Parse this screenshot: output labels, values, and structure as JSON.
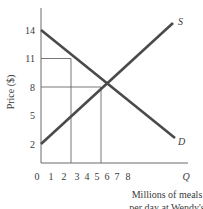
{
  "chart_data": {
    "type": "line",
    "title": "",
    "xlabel": "Millions of meals per day at Wendy's",
    "xlabel_lines": [
      "Millions of meals",
      "per day at Wendy's"
    ],
    "ylabel": "Price ($)",
    "x_axis_end_label": "Q",
    "xlim": [
      0,
      10.5
    ],
    "ylim": [
      0,
      15
    ],
    "x_ticks": [
      0,
      1,
      2,
      3,
      4,
      5,
      6,
      7,
      8
    ],
    "x_tick_labels": [
      "0",
      "1",
      "2",
      "3",
      "4",
      "5",
      "6",
      "7",
      "8"
    ],
    "y_ticks": [
      2,
      5,
      8,
      11,
      14
    ],
    "y_tick_labels": [
      "2",
      "5",
      "8",
      "11",
      "14"
    ],
    "grid": false,
    "series": [
      {
        "name": "S",
        "label": "S",
        "points": [
          [
            0,
            2
          ],
          [
            10,
            14
          ]
        ]
      },
      {
        "name": "D",
        "label": "D",
        "points": [
          [
            0,
            14
          ],
          [
            10,
            4
          ]
        ]
      }
    ],
    "reference_lines": [
      {
        "from": [
          0,
          11
        ],
        "to": [
          3,
          11
        ]
      },
      {
        "from": [
          3,
          0
        ],
        "to": [
          3,
          11
        ]
      },
      {
        "from": [
          0,
          8
        ],
        "to": [
          6,
          8
        ]
      },
      {
        "from": [
          6,
          0
        ],
        "to": [
          6,
          8
        ]
      }
    ],
    "colors": {
      "curves": "#4a4a4a",
      "axes": "#6a6a6a",
      "guides": "#555555"
    }
  }
}
